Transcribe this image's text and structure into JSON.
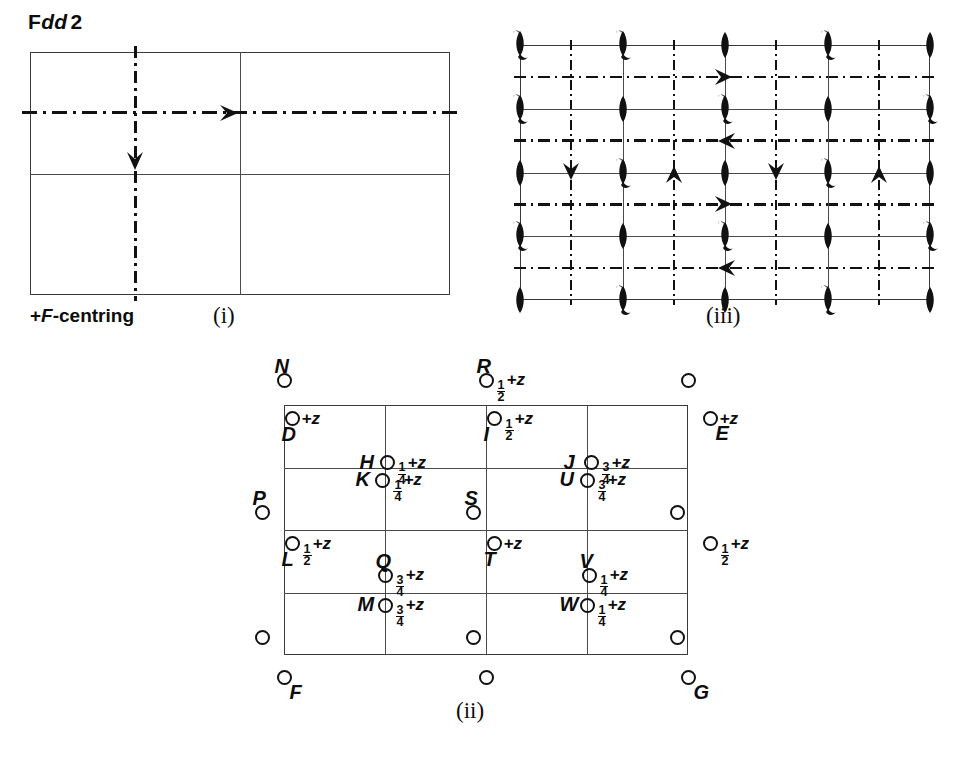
{
  "page": {
    "space_group": "Fdd2",
    "centring_note": "+F-centring",
    "captions": {
      "i": "(i)",
      "ii": "(ii)",
      "iii": "(iii)"
    }
  },
  "diagram_i": {
    "name": "symmetry-element-diagram-i",
    "description": "unit cell outline with 2-fold screw axis arrows",
    "cell": {
      "x": 30,
      "y": 52,
      "w": 420,
      "h": 243
    },
    "grid_lines": [
      {
        "type": "vertical",
        "pos": 0.5
      },
      {
        "type": "horizontal",
        "pos": 0.5
      }
    ],
    "glide_lines": [
      {
        "type": "horizontal",
        "pos": 0.25,
        "style": "dash-dot"
      },
      {
        "type": "vertical",
        "pos": 0.25,
        "style": "dash-dot"
      }
    ],
    "axis_arrows": [
      {
        "direction": "right",
        "x": 0.5,
        "y": 0.25
      },
      {
        "direction": "down",
        "x": 0.25,
        "y": 0.5
      }
    ]
  },
  "diagram_iii": {
    "name": "symmetry-element-diagram-iii",
    "description": "F-centred cell, full set of d-glides, 2-fold and 2-fold screw axes",
    "cell": {
      "x": 520,
      "y": 45,
      "w": 410,
      "h": 255
    },
    "symbol_columns": 5,
    "symbol_rows": 5,
    "symbols": [
      [
        "lens-tail",
        "lens-tail",
        "lens",
        "lens-tail",
        "lens"
      ],
      [
        "lens-tail",
        "lens",
        "lens-tail",
        "lens",
        "lens-tail"
      ],
      [
        "lens",
        "lens-tail",
        "lens",
        "lens-tail",
        "lens"
      ],
      [
        "lens-tail",
        "lens",
        "lens-tail",
        "lens",
        "lens-tail"
      ],
      [
        "lens",
        "lens-tail",
        "lens",
        "lens-tail",
        "lens"
      ]
    ],
    "glide_lines_horizontal": [
      0.125,
      0.375,
      0.625,
      0.875
    ],
    "glide_lines_vertical": [
      0.125,
      0.375,
      0.625,
      0.875
    ],
    "axis_arrows": [
      {
        "direction": "right",
        "x": 0.5,
        "y": 0.125
      },
      {
        "direction": "left",
        "x": 0.5,
        "y": 0.375
      },
      {
        "direction": "right",
        "x": 0.5,
        "y": 0.625
      },
      {
        "direction": "left",
        "x": 0.5,
        "y": 0.875
      },
      {
        "direction": "down",
        "x": 0.125,
        "y": 0.5
      },
      {
        "direction": "up",
        "x": 0.375,
        "y": 0.5
      },
      {
        "direction": "down",
        "x": 0.625,
        "y": 0.5
      },
      {
        "direction": "up",
        "x": 0.875,
        "y": 0.5
      }
    ]
  },
  "diagram_ii": {
    "name": "general-position-diagram-ii",
    "description": "general equivalent positions of space group Fdd2",
    "cell": {
      "x": 284,
      "y": 405,
      "w": 404,
      "h": 250
    },
    "columns": 4,
    "rows": 4,
    "inside_atoms": [
      {
        "id": "D",
        "letter": "D",
        "height": "+z",
        "frac": "",
        "lx": 0.02,
        "ly": 0.055,
        "letter_pos": "below-left",
        "label_pos": "right"
      },
      {
        "id": "H",
        "letter": "H",
        "height": "+z",
        "frac": "1/4",
        "lx": 0.255,
        "ly": 0.23,
        "letter_pos": "left",
        "label_pos": "right"
      },
      {
        "id": "I",
        "letter": "I",
        "height": "+z",
        "frac": "1/2",
        "lx": 0.52,
        "ly": 0.055,
        "letter_pos": "below-left",
        "label_pos": "right"
      },
      {
        "id": "J",
        "letter": "J",
        "height": "+z",
        "frac": "3/4",
        "lx": 0.76,
        "ly": 0.23,
        "letter_pos": "left",
        "label_pos": "right"
      },
      {
        "id": "K",
        "letter": "K",
        "height": "+z",
        "frac": "1/4",
        "lx": 0.245,
        "ly": 0.3,
        "letter_pos": "left",
        "label_pos": "right"
      },
      {
        "id": "U",
        "letter": "U",
        "height": "+z",
        "frac": "3/4",
        "lx": 0.75,
        "ly": 0.3,
        "letter_pos": "left",
        "label_pos": "right"
      },
      {
        "id": "S",
        "letter": "S",
        "height": "+z",
        "frac": "",
        "lx": 0.47,
        "ly": 0.43,
        "letter_pos": "above",
        "label_pos": "left"
      },
      {
        "id": "R2",
        "letter": "",
        "height": "+z",
        "frac": "1/4",
        "lx": 0.975,
        "ly": 0.43,
        "letter_pos": "none",
        "label_pos": "left"
      },
      {
        "id": "L",
        "letter": "L",
        "height": "+z",
        "frac": "1/2",
        "lx": 0.02,
        "ly": 0.555,
        "letter_pos": "below-left",
        "label_pos": "right"
      },
      {
        "id": "Q",
        "letter": "Q",
        "height": "+z",
        "frac": "3/4",
        "lx": 0.25,
        "ly": 0.68,
        "letter_pos": "above",
        "label_pos": "right"
      },
      {
        "id": "T",
        "letter": "T",
        "height": "+z",
        "frac": "",
        "lx": 0.52,
        "ly": 0.555,
        "letter_pos": "below-left",
        "label_pos": "right"
      },
      {
        "id": "V",
        "letter": "V",
        "height": "+z",
        "frac": "1/4",
        "lx": 0.755,
        "ly": 0.68,
        "letter_pos": "above",
        "label_pos": "right"
      },
      {
        "id": "M",
        "letter": "M",
        "height": "+z",
        "frac": "3/4",
        "lx": 0.25,
        "ly": 0.8,
        "letter_pos": "left",
        "label_pos": "right"
      },
      {
        "id": "W",
        "letter": "W",
        "height": "+z",
        "frac": "1/4",
        "lx": 0.75,
        "ly": 0.8,
        "letter_pos": "left",
        "label_pos": "right"
      },
      {
        "id": "B1",
        "letter": "",
        "height": "+z",
        "frac": "1/2",
        "lx": 0.47,
        "ly": 0.93,
        "letter_pos": "none",
        "label_pos": "left"
      },
      {
        "id": "B2",
        "letter": "",
        "height": "+z",
        "frac": "",
        "lx": 0.975,
        "ly": 0.93,
        "letter_pos": "none",
        "label_pos": "left"
      }
    ],
    "outside_atoms": [
      {
        "id": "N",
        "letter": "N",
        "height": "+z",
        "frac": "",
        "side": "top",
        "pos": 0.0,
        "letter_pos": "above",
        "label_pos": "left"
      },
      {
        "id": "R",
        "letter": "R",
        "height": "+z",
        "frac": "1/2",
        "side": "top",
        "pos": 0.5,
        "letter_pos": "above",
        "label_pos": "right"
      },
      {
        "id": "TC",
        "letter": "",
        "height": "+z",
        "frac": "",
        "side": "top",
        "pos": 1.0,
        "letter_pos": "none",
        "label_pos": "left"
      },
      {
        "id": "E",
        "letter": "E",
        "height": "+z",
        "frac": "",
        "side": "right",
        "pos": 0.055,
        "letter_pos": "below",
        "label_pos": "right"
      },
      {
        "id": "RE",
        "letter": "",
        "height": "+z",
        "frac": "1/2",
        "side": "right",
        "pos": 0.555,
        "letter_pos": "none",
        "label_pos": "right"
      },
      {
        "id": "P",
        "letter": "P",
        "height": "+z",
        "frac": "1/4",
        "side": "left",
        "pos": 0.43,
        "letter_pos": "above",
        "label_pos": "left"
      },
      {
        "id": "LT",
        "letter": "",
        "height": "+z",
        "frac": "",
        "side": "left",
        "pos": 0.93,
        "letter_pos": "none",
        "label_pos": "left"
      },
      {
        "id": "F",
        "letter": "F",
        "height": "+z",
        "frac": "",
        "side": "bottom",
        "pos": 0.0,
        "letter_pos": "below",
        "label_pos": "left"
      },
      {
        "id": "BC",
        "letter": "",
        "height": "+z",
        "frac": "1/2",
        "side": "bottom",
        "pos": 0.5,
        "letter_pos": "none",
        "label_pos": "left"
      },
      {
        "id": "G",
        "letter": "G",
        "height": "+z",
        "frac": "",
        "side": "bottom",
        "pos": 1.0,
        "letter_pos": "below",
        "label_pos": "left"
      }
    ]
  },
  "text": {
    "plus_z": "+z",
    "frac_quarter_num": "1",
    "frac_quarter_den": "4",
    "frac_half_num": "1",
    "frac_half_den": "2",
    "frac_three_quarter_num": "3",
    "frac_three_quarter_den": "4"
  },
  "colors": {
    "ink": "#0d0d0d",
    "rule": "#3a3a3a",
    "paper": "#ffffff"
  }
}
